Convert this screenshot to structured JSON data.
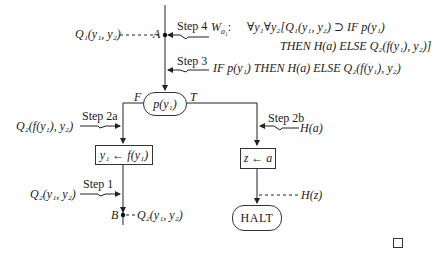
{
  "diagram": {
    "steps": {
      "step4": {
        "label": "Step 4",
        "formula_name": "W",
        "formula_sub": "a₁",
        "colon": ":",
        "line1": "∀y₁∀y₂[Q₁(y₁, y₂) ⊃ IF p(y₁)",
        "line2": "THEN H(a) ELSE Q₂(f(y₁), y₂)]"
      },
      "step3": {
        "label": "Step 3",
        "formula": "IF p(y₁) THEN H(a) ELSE Q₂(f(y₁), y₂)"
      },
      "step2a": {
        "label": "Step 2a",
        "formula": "Q₂(f(y₁), y₂)"
      },
      "step2b": {
        "label": "Step 2b",
        "formula": "H(a)"
      },
      "step1": {
        "label": "Step 1",
        "formula": "Q₂(y₁, y₂)"
      }
    },
    "points": {
      "A": {
        "label": "A",
        "assertion": "Q₁(y₁, y₂)"
      },
      "B": {
        "label": "B",
        "assertion": "Q₂(y₁, y₂)"
      }
    },
    "nodes": {
      "test": {
        "label": "p(y₁)",
        "false_label": "F",
        "true_label": "T"
      },
      "assign_y1": {
        "label": "y₁ ← f(y₁)"
      },
      "assign_z": {
        "label": "z ← a"
      },
      "halt": {
        "label": "HALT",
        "assertion": "H(z)"
      }
    },
    "end_mark": "□"
  }
}
